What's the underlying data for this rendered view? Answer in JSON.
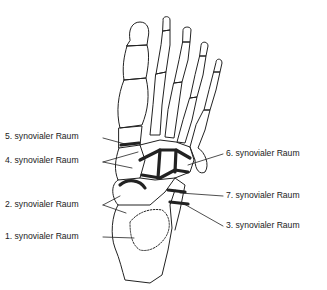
{
  "diagram": {
    "labels": [
      {
        "id": "5",
        "text": "5. synovialer Raum",
        "x": 5,
        "y": 135
      },
      {
        "id": "4",
        "text": "4. synovialer Raum",
        "x": 5,
        "y": 159
      },
      {
        "id": "2",
        "text": "2. synovialer Raum",
        "x": 5,
        "y": 203
      },
      {
        "id": "1",
        "text": "1. synovialer Raum",
        "x": 5,
        "y": 234
      },
      {
        "id": "6",
        "text": "6. synovialer Raum",
        "x": 225,
        "y": 152
      },
      {
        "id": "7",
        "text": "7. synovialer Raum",
        "x": 225,
        "y": 193
      },
      {
        "id": "3",
        "text": "3. synovialer Raum",
        "x": 225,
        "y": 223
      }
    ],
    "colors": {
      "line": "#222222",
      "background": "#ffffff"
    }
  }
}
